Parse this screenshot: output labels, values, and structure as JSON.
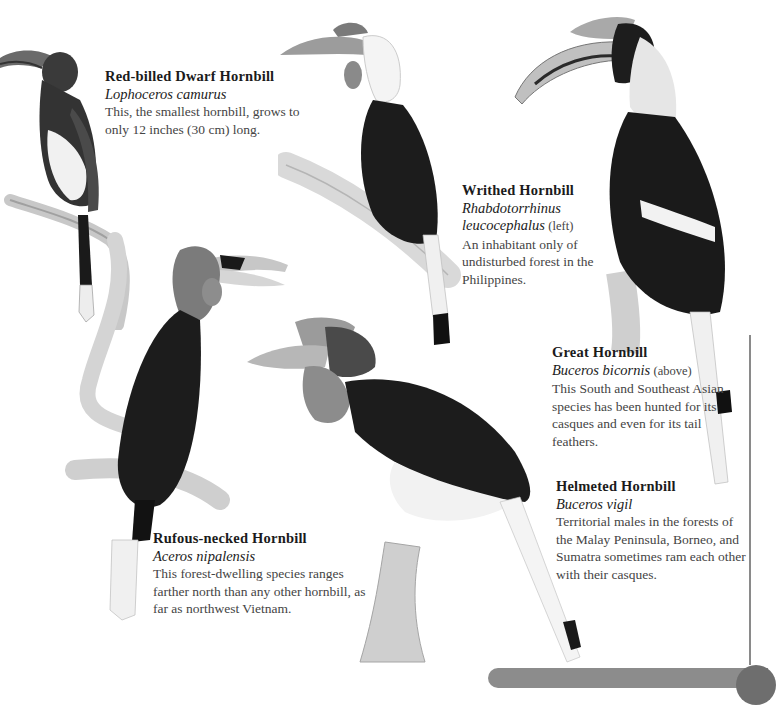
{
  "species": [
    {
      "common_name": "Red-billed Dwarf Hornbill",
      "scientific_name": "Lophoceros camurus",
      "note": "",
      "description": "This, the smallest hornbill, grows to only 12 inches (30 cm) long."
    },
    {
      "common_name": "Writhed Hornbill",
      "scientific_name_line1": "Rhabdotorrhinus",
      "scientific_name_line2": "leucocephalus",
      "note": "(left)",
      "description": "An inhabitant only of undisturbed forest in the Philippines."
    },
    {
      "common_name": "Great Hornbill",
      "scientific_name": "Buceros bicornis",
      "note": "(above)",
      "description": "This South and Southeast Asian species has been hunted for its casques and even for its tail feathers."
    },
    {
      "common_name": "Helmeted Hornbill",
      "scientific_name": "Buceros vigil",
      "note": "",
      "description": "Territorial males in the forests of the Malay Peninsula, Borneo, and Sumatra sometimes ram each other with their casques."
    },
    {
      "common_name": "Rufous-necked Hornbill",
      "scientific_name": "Aceros nipalensis",
      "note": "",
      "description": "This forest-dwelling species ranges farther north than any other hornbill, as far as northwest Vietnam."
    }
  ],
  "colors": {
    "plumage_dark": "#1e1e1e",
    "plumage_white": "#f2f2f2",
    "bill": "#b5b5b5",
    "branch": "#d6d6d6",
    "rule": "#8a8a8a",
    "footer_bar": "#8c8c8c"
  }
}
